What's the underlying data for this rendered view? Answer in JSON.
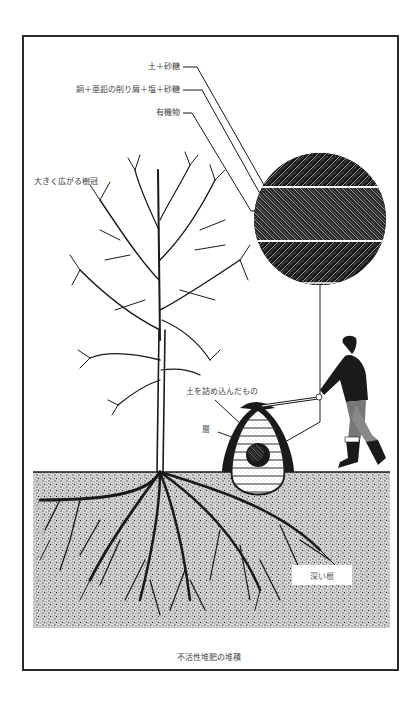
{
  "figure": {
    "caption": "不活性堆肥の堆積",
    "labels": {
      "soil_sugar": "土＋砂糖",
      "metal_shavings": "銅＋亜鉛の削り屑＋塩＋砂糖",
      "organic": "有機物",
      "crown": "大きく広がる樹冠",
      "packed_soil": "土を詰め込んだもの",
      "layers": "層",
      "deep_roots": "深い根"
    },
    "colors": {
      "ink": "#1a1a1a",
      "frame": "#2a2a2a",
      "soil_stipple": "#8a8a8a",
      "paper": "#ffffff"
    }
  }
}
